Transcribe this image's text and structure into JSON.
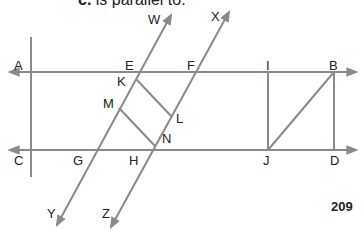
{
  "caption": {
    "prefix": "c.",
    "text": "is parallel to:"
  },
  "page_number": "209",
  "colors": {
    "line": "#8a8a8a",
    "text": "#222222"
  },
  "labels": [
    {
      "id": "W",
      "text": "W",
      "x": 148,
      "y": 13
    },
    {
      "id": "X",
      "text": "X",
      "x": 211,
      "y": 10
    },
    {
      "id": "A",
      "text": "A",
      "x": 14,
      "y": 59
    },
    {
      "id": "E",
      "text": "E",
      "x": 125,
      "y": 59
    },
    {
      "id": "F",
      "text": "F",
      "x": 187,
      "y": 59
    },
    {
      "id": "I",
      "text": "I",
      "x": 266,
      "y": 59
    },
    {
      "id": "B",
      "text": "B",
      "x": 329,
      "y": 59
    },
    {
      "id": "K",
      "text": "K",
      "x": 117,
      "y": 75
    },
    {
      "id": "M",
      "text": "M",
      "x": 103,
      "y": 97
    },
    {
      "id": "L",
      "text": "L",
      "x": 176,
      "y": 112
    },
    {
      "id": "N",
      "text": "N",
      "x": 162,
      "y": 132
    },
    {
      "id": "C",
      "text": "C",
      "x": 14,
      "y": 154
    },
    {
      "id": "G",
      "text": "G",
      "x": 73,
      "y": 154
    },
    {
      "id": "H",
      "text": "H",
      "x": 129,
      "y": 154
    },
    {
      "id": "J",
      "text": "J",
      "x": 263,
      "y": 154
    },
    {
      "id": "D",
      "text": "D",
      "x": 330,
      "y": 154
    },
    {
      "id": "Y",
      "text": "Y",
      "x": 47,
      "y": 207
    },
    {
      "id": "Z",
      "text": "Z",
      "x": 102,
      "y": 207
    }
  ]
}
